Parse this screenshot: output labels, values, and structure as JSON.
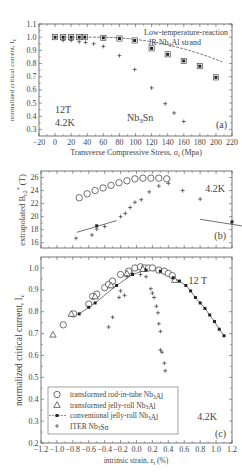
{
  "chart_data": [
    {
      "id": "a",
      "type": "scatter",
      "panel_label": "(a)",
      "xlabel": "Transverse Compressive Stress, σt (Mpa)",
      "ylabel": "normalized critical current, Ic",
      "xlim": [
        -20,
        220
      ],
      "ylim": [
        0.25,
        1.1
      ],
      "xticks": [
        -20,
        0,
        20,
        40,
        60,
        80,
        100,
        120,
        140,
        160,
        180,
        200,
        220
      ],
      "yticks": [
        0.3,
        0.4,
        0.5,
        0.6,
        0.7,
        0.8,
        0.9,
        1.0,
        1.1
      ],
      "annotations": [
        "Low-temperature-reaction",
        "JR Nb3Al strand",
        "12T",
        "4.2K",
        "Nb3Sn"
      ],
      "series": [
        {
          "name": "Low-temperature-reaction JR Nb3Al strand",
          "marker": "boxed-square",
          "line": "fit-dashed",
          "x": [
            0,
            10,
            20,
            30,
            37,
            60,
            80,
            99,
            120,
            140,
            160,
            180,
            200
          ],
          "y": [
            1.0,
            1.0,
            1.0,
            1.0,
            1.0,
            0.995,
            0.99,
            0.975,
            0.915,
            0.87,
            0.82,
            0.78,
            0.695
          ]
        },
        {
          "name": "Nb3Sn",
          "marker": "plus",
          "x": [
            10,
            20,
            30,
            38,
            48,
            60,
            80,
            99,
            120,
            137,
            148,
            160
          ],
          "y": [
            0.975,
            0.975,
            0.965,
            0.96,
            0.95,
            0.93,
            0.86,
            0.755,
            0.615,
            0.495,
            0.425,
            0.36
          ]
        }
      ]
    },
    {
      "id": "b",
      "type": "scatter",
      "panel_label": "(b)",
      "xlabel": "",
      "ylabel": "extrapolated B*c2 (T)",
      "xlim": [
        -1.2,
        1.2
      ],
      "ylim": [
        15.2,
        27
      ],
      "yticks": [
        16,
        18,
        20,
        22,
        24,
        26
      ],
      "annotations": [
        "4.2K"
      ],
      "series": [
        {
          "name": "transformed rod-in-tube Nb3Al",
          "marker": "circle",
          "x": [
            -0.72,
            -0.62,
            -0.52,
            -0.42,
            -0.32,
            -0.22,
            -0.12,
            -0.02,
            0.08,
            0.18,
            0.28,
            0.38
          ],
          "y": [
            22.9,
            23.5,
            24.0,
            24.4,
            24.8,
            25.2,
            25.5,
            25.8,
            25.9,
            25.9,
            25.9,
            25.8
          ]
        },
        {
          "name": "ITER Nb3Sn",
          "marker": "plus",
          "x": [
            -0.76,
            -0.56,
            -0.5,
            -0.4,
            -0.2,
            -0.14,
            -0.08,
            -0.02,
            0.06,
            0.16,
            0.28,
            0.4,
            0.58,
            0.8
          ],
          "y": [
            16.7,
            17.2,
            18.1,
            18.5,
            20.0,
            20.5,
            21.4,
            22.2,
            22.6,
            23.8,
            24.7,
            25.1,
            24.0,
            22.7
          ]
        },
        {
          "name": "conventional jelly-roll Nb3Al",
          "marker": "filled-square",
          "line": "fit",
          "x": [
            -0.5,
            1.15
          ],
          "y": [
            18.6,
            19.2
          ]
        }
      ]
    },
    {
      "id": "c",
      "type": "scatter",
      "panel_label": "(c)",
      "xlabel": "intrinsic strain, εt (%)",
      "ylabel": "normalized critical current, Ic",
      "xlim": [
        -1.2,
        1.2
      ],
      "ylim": [
        0.2,
        1.05
      ],
      "xticks": [
        -1.2,
        -1.0,
        -0.8,
        -0.6,
        -0.4,
        -0.2,
        0.0,
        0.2,
        0.4,
        0.6,
        0.8,
        1.0,
        1.2
      ],
      "yticks": [
        0.2,
        0.3,
        0.4,
        0.5,
        0.6,
        0.7,
        0.8,
        0.9,
        1.0
      ],
      "annotations": [
        "12 T",
        "4.2K"
      ],
      "legend": [
        {
          "marker": "circle",
          "label": "transformed rod-in-tube Nb3Al"
        },
        {
          "marker": "triangle",
          "label": "transformed jelly-roll Nb3Al"
        },
        {
          "marker": "filled-square-line",
          "label": "conventional jelly-roll Nb3Al"
        },
        {
          "marker": "plus",
          "label": "ITER Nb3Sn"
        }
      ],
      "series": [
        {
          "name": "transformed rod-in-tube Nb3Al",
          "marker": "circle",
          "x": [
            -0.92,
            -0.79,
            -0.6,
            -0.55,
            -0.5,
            -0.4,
            -0.35,
            -0.3,
            -0.2,
            -0.1,
            -0.02,
            0.05,
            0.1,
            0.15,
            0.2,
            0.28,
            0.35,
            0.4,
            0.45
          ],
          "y": [
            0.74,
            0.79,
            0.835,
            0.87,
            0.88,
            0.91,
            0.925,
            0.94,
            0.97,
            0.985,
            1.0,
            1.005,
            1.0,
            1.0,
            1.0,
            0.99,
            0.985,
            0.975,
            0.965
          ]
        },
        {
          "name": "transformed jelly-roll Nb3Al",
          "marker": "triangle",
          "x": [
            -1.05,
            -0.82,
            -0.52,
            -0.32,
            -0.12,
            0.08,
            0.48
          ],
          "y": [
            0.695,
            0.79,
            0.87,
            0.92,
            0.975,
            0.995,
            0.945
          ]
        },
        {
          "name": "conventional jelly-roll Nb3Al",
          "marker": "filled-square",
          "line": "fit",
          "x": [
            -0.72,
            -0.6,
            -0.52,
            -0.25,
            -0.05,
            0.12,
            0.3,
            0.46,
            0.54,
            0.62,
            0.68,
            0.74,
            0.8,
            0.86,
            0.92,
            0.98,
            1.04,
            1.1
          ],
          "y": [
            0.79,
            0.82,
            0.84,
            0.92,
            0.97,
            0.99,
            0.985,
            0.955,
            0.94,
            0.92,
            0.895,
            0.865,
            0.84,
            0.815,
            0.785,
            0.755,
            0.72,
            0.69
          ]
        },
        {
          "name": "ITER Nb3Sn",
          "marker": "plus",
          "x": [
            -0.35,
            -0.3,
            -0.22,
            -0.2,
            -0.15,
            -0.12,
            -0.05,
            0.05,
            0.12,
            0.18,
            0.2,
            0.22,
            0.25,
            0.27,
            0.28,
            0.3,
            0.3,
            0.32,
            0.35,
            0.36
          ],
          "y": [
            0.73,
            0.775,
            0.865,
            0.895,
            0.875,
            0.96,
            0.975,
            0.97,
            0.96,
            0.905,
            0.885,
            0.865,
            0.825,
            0.795,
            0.745,
            0.71,
            0.625,
            0.615,
            0.565,
            0.53
          ]
        }
      ]
    }
  ],
  "figure": {
    "panel_a": {
      "xlabel": "Transverse Compressive Stress, σ",
      "xlabel_sub": "t",
      "xlabel_end": " (Mpa)",
      "ylabel": "normalized critical current, I",
      "ylabel_sub": "c",
      "ann1": "Low-temperature-reaction",
      "ann2a": "JR Nb",
      "ann2sub": "3",
      "ann2b": "Al strand",
      "ann_field": "12T",
      "ann_temp": "4.2K",
      "ann_sn": "Nb",
      "ann_sn_sub": "3",
      "ann_sn_end": "Sn",
      "label": "(a)"
    },
    "panel_b": {
      "ylabel": "extrapolated B",
      "ylabel_sub": "c2",
      "ylabel_sup": "*",
      "ylabel_end": " (T)",
      "ann_temp": "4.2K",
      "label": "(b)"
    },
    "panel_c": {
      "xlabel": "intrinsic strain, ε",
      "xlabel_sub": "t",
      "xlabel_end": " (%)",
      "ylabel": "normalized critical current, I",
      "ylabel_sub": "c",
      "ann_field": "12 T",
      "ann_temp": "4.2K",
      "label": "(c)"
    }
  }
}
